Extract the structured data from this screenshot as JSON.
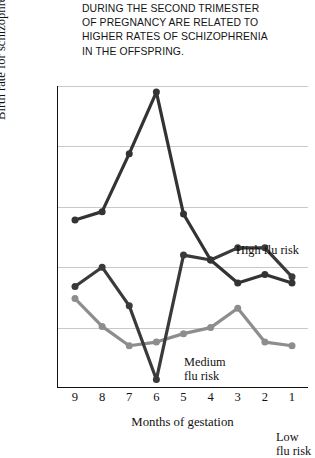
{
  "caption": {
    "lines": [
      "DURING THE SECOND TRIMESTER",
      "OF PREGNANCY ARE RELATED TO",
      "HIGHER RATES OF SCHIZOPHRENIA",
      "IN THE OFFSPRING."
    ]
  },
  "chart_data": {
    "type": "line",
    "title": "",
    "xlabel": "Months of gestation",
    "ylabel": "Birth rate for schizophrenia per 1,000",
    "categories": [
      "9",
      "8",
      "7",
      "6",
      "5",
      "4",
      "3",
      "2",
      "1"
    ],
    "x": [
      9,
      8,
      7,
      6,
      5,
      4,
      3,
      2,
      1
    ],
    "xlim": [
      9,
      1
    ],
    "ylim": [
      -0.1,
      0.15
    ],
    "yticks": [
      ".15",
      ".10",
      ".05",
      "0",
      "-.05",
      "-.10"
    ],
    "ytick_values": [
      0.15,
      0.1,
      0.05,
      0,
      -0.05,
      -0.1
    ],
    "grid": true,
    "legend": "inline-annotations",
    "series": [
      {
        "name": "High flu risk",
        "color": "#333333",
        "values": [
          0.039,
          0.046,
          0.094,
          0.145,
          0.044,
          0.006,
          -0.013,
          -0.006,
          -0.013
        ]
      },
      {
        "name": "Medium flu risk",
        "color": "#3a3a3a",
        "values": [
          -0.016,
          0.0,
          -0.032,
          -0.093,
          0.01,
          0.006,
          0.016,
          0.016,
          -0.008
        ]
      },
      {
        "name": "Low flu risk",
        "color": "#8d8d8d",
        "values": [
          -0.026,
          -0.049,
          -0.065,
          -0.062,
          -0.055,
          -0.05,
          -0.034,
          -0.062,
          -0.065
        ]
      }
    ],
    "annotations": [
      {
        "text": "High flu risk",
        "for": "High flu risk"
      },
      {
        "text": "Medium",
        "text2": "flu risk",
        "for": "Medium flu risk"
      },
      {
        "text": "Low",
        "text2": "flu risk",
        "for": "Low flu risk"
      }
    ]
  }
}
